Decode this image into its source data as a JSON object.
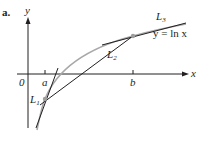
{
  "figure": {
    "panel_label": "a.",
    "axes": {
      "x_label": "x",
      "y_label": "y",
      "origin_label": "0"
    },
    "ticks": {
      "a_label": "a",
      "b_label": "b"
    },
    "curve_label": "y = ln x",
    "lines": {
      "L1": "L",
      "L1_sub": "1",
      "L2": "L",
      "L2_sub": "2",
      "L3": "L",
      "L3_sub": "3"
    },
    "colors": {
      "curve": "#9d9d9d",
      "lines": "#231f20",
      "points": "#9d9d9d"
    }
  }
}
